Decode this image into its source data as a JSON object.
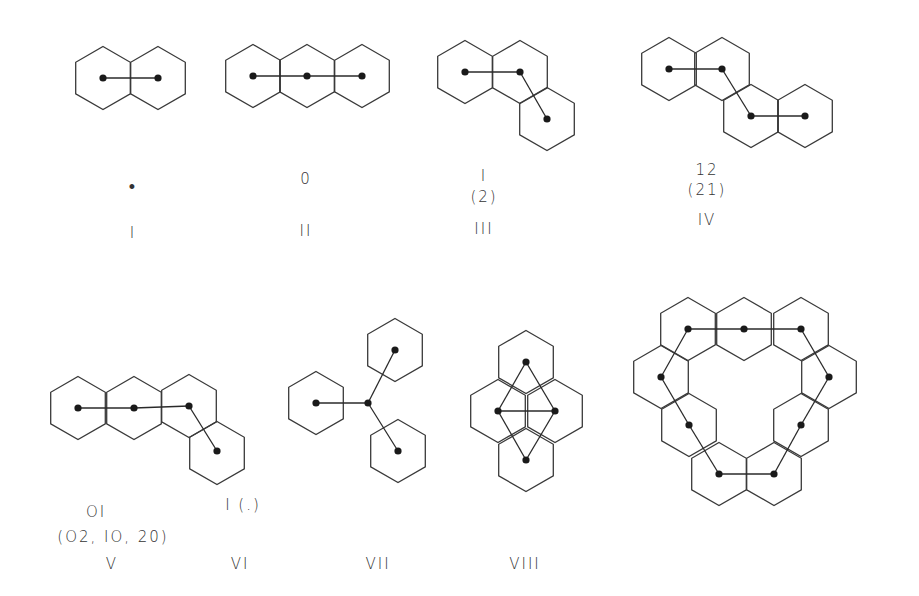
{
  "figure": {
    "style": {
      "stroke": "#3a3a3a",
      "dot": "#1a1a1a",
      "background": "#ffffff",
      "hex_radius": 31.5
    },
    "molecules": [
      {
        "id": "I",
        "numeral": "I",
        "code": "•",
        "code_alt": "",
        "hexes": [
          [
            103,
            78
          ],
          [
            158,
            78
          ]
        ],
        "nodes": [
          [
            103,
            78
          ],
          [
            158,
            78
          ]
        ],
        "edges": [
          [
            0,
            1
          ]
        ],
        "code_pos": [
          133,
          187
        ],
        "alt_pos": [
          133,
          210
        ],
        "numeral_pos": [
          133,
          234
        ]
      },
      {
        "id": "II",
        "numeral": "II",
        "code": "0",
        "code_alt": "",
        "hexes": [
          [
            253,
            76
          ],
          [
            307,
            76
          ],
          [
            362,
            76
          ]
        ],
        "nodes": [
          [
            253,
            76
          ],
          [
            307,
            76
          ],
          [
            362,
            76
          ]
        ],
        "edges": [
          [
            0,
            1
          ],
          [
            1,
            2
          ]
        ],
        "code_pos": [
          306,
          180
        ],
        "alt_pos": [
          306,
          203
        ],
        "numeral_pos": [
          306,
          232
        ]
      },
      {
        "id": "III",
        "numeral": "III",
        "code": "I",
        "code_alt": "(2)",
        "hexes": [
          [
            465,
            72
          ],
          [
            520,
            72
          ],
          [
            547,
            119
          ]
        ],
        "nodes": [
          [
            465,
            72
          ],
          [
            520,
            72
          ],
          [
            547,
            119
          ]
        ],
        "edges": [
          [
            0,
            1
          ],
          [
            1,
            2
          ]
        ],
        "code_pos": [
          484,
          177
        ],
        "alt_pos": [
          484,
          199
        ],
        "numeral_pos": [
          484,
          230
        ]
      },
      {
        "id": "IV",
        "numeral": "IV",
        "code": "12",
        "code_alt": "(21)",
        "hexes": [
          [
            669,
            69
          ],
          [
            722,
            69
          ],
          [
            751,
            116
          ],
          [
            805,
            116
          ]
        ],
        "nodes": [
          [
            669,
            69
          ],
          [
            722,
            69
          ],
          [
            751,
            116
          ],
          [
            805,
            116
          ]
        ],
        "edges": [
          [
            0,
            1
          ],
          [
            1,
            2
          ],
          [
            2,
            3
          ]
        ],
        "code_pos": [
          705,
          170
        ],
        "alt_pos": [
          705,
          190
        ],
        "numeral_pos": [
          705,
          221
        ]
      },
      {
        "id": "V",
        "numeral": "V",
        "code": "OI",
        "code_alt": "(O2, IO, 20)",
        "hexes": [
          [
            78,
            408
          ],
          [
            134,
            408
          ],
          [
            189,
            406
          ],
          [
            217,
            453
          ]
        ],
        "nodes": [
          [
            78,
            408
          ],
          [
            134,
            408
          ],
          [
            189,
            406
          ],
          [
            217,
            451
          ]
        ],
        "edges": [
          [
            0,
            1
          ],
          [
            1,
            2
          ],
          [
            2,
            3
          ]
        ],
        "code_pos": [
          93,
          512
        ],
        "alt_pos": [
          132,
          548
        ],
        "numeral_pos": [
          112,
          565
        ]
      },
      {
        "id": "VI",
        "numeral": "VI",
        "code": "I (.)",
        "code_alt": "",
        "hexes": [
          [
            316,
            403
          ],
          [
            395,
            350
          ],
          [
            398,
            451
          ]
        ],
        "nodes": [
          [
            316,
            403
          ],
          [
            368,
            403
          ],
          [
            395,
            350
          ],
          [
            398,
            451
          ]
        ],
        "edges": [
          [
            0,
            1
          ],
          [
            1,
            2
          ],
          [
            1,
            3
          ]
        ],
        "code_pos": [
          330,
          508
        ],
        "alt_pos": [
          330,
          530
        ],
        "numeral_pos": [
          240,
          565
        ]
      },
      {
        "id": "VII",
        "numeral": "VII",
        "code": "",
        "code_alt": "",
        "hexes": [
          [
            526,
            362
          ],
          [
            498,
            411
          ],
          [
            555,
            411
          ],
          [
            526,
            460
          ]
        ],
        "nodes": [
          [
            526,
            362
          ],
          [
            498,
            411
          ],
          [
            555,
            411
          ],
          [
            526,
            460
          ]
        ],
        "edges": [
          [
            0,
            1
          ],
          [
            0,
            2
          ],
          [
            1,
            2
          ],
          [
            1,
            3
          ],
          [
            2,
            3
          ]
        ],
        "code_pos": [
          526,
          505
        ],
        "alt_pos": [
          526,
          530
        ],
        "numeral_pos": [
          526,
          565
        ]
      },
      {
        "id": "VIII",
        "numeral": "VIII",
        "code": "",
        "code_alt": "",
        "hexes": [
          [
            688,
            329
          ],
          [
            744,
            329
          ],
          [
            801,
            329
          ],
          [
            661,
            377
          ],
          [
            829,
            377
          ],
          [
            689,
            425
          ],
          [
            801,
            425
          ],
          [
            719,
            474
          ],
          [
            774,
            474
          ]
        ],
        "nodes": [
          [
            688,
            329
          ],
          [
            744,
            329
          ],
          [
            801,
            329
          ],
          [
            829,
            377
          ],
          [
            801,
            425
          ],
          [
            774,
            474
          ],
          [
            719,
            474
          ],
          [
            689,
            425
          ],
          [
            661,
            377
          ]
        ],
        "edges": [
          [
            0,
            1
          ],
          [
            1,
            2
          ],
          [
            2,
            3
          ],
          [
            3,
            4
          ],
          [
            4,
            5
          ],
          [
            5,
            6
          ],
          [
            6,
            7
          ],
          [
            7,
            8
          ],
          [
            8,
            0
          ]
        ],
        "code_pos": [
          745,
          505
        ],
        "alt_pos": [
          745,
          530
        ],
        "numeral_pos": [
          745,
          565
        ]
      }
    ],
    "labels": {
      "I": {
        "code": "•",
        "alt": "",
        "numeral": "I"
      },
      "II": {
        "code": "0",
        "alt": "",
        "numeral": "II"
      },
      "III": {
        "code": "I",
        "alt": "(2)",
        "numeral": "III"
      },
      "IV": {
        "code": "12",
        "alt": "(21)",
        "numeral": "IV"
      },
      "V": {
        "code": "OI",
        "alt": "(O2, IO, 20)",
        "numeral": "V"
      },
      "VI": {
        "code": "I (.)",
        "alt": "",
        "numeral": "VI"
      },
      "VII": {
        "code": "",
        "alt": "",
        "numeral": "VII"
      },
      "VIII": {
        "code": "",
        "alt": "",
        "numeral": "VIII"
      }
    }
  }
}
